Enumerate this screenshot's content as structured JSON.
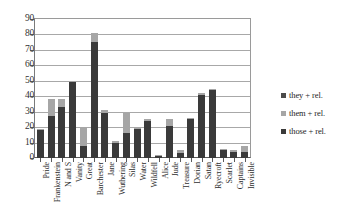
{
  "chart_data": {
    "type": "bar",
    "stacked": true,
    "title": "",
    "xlabel": "",
    "ylabel": "",
    "ylim": [
      0,
      90
    ],
    "ytick_step": 10,
    "yticks": [
      0,
      10,
      20,
      30,
      40,
      50,
      60,
      70,
      80,
      90
    ],
    "grid": true,
    "legend_position": "right",
    "categories": [
      "Pride",
      "Frankenstein",
      "N and S",
      "Vanity",
      "Great",
      "Barchester",
      "Jane",
      "Wuthering",
      "Silas",
      "Water",
      "Wildfell",
      "Alice",
      "Jude",
      "Treasure",
      "Dorian",
      "Satan",
      "Ryecroft",
      "Scarlet",
      "Captains",
      "Invisible"
    ],
    "series": [
      {
        "name": "those + rel.",
        "color": "#3a3a3a",
        "values": [
          18,
          27,
          33,
          49,
          8,
          75,
          29,
          10,
          16,
          19,
          24,
          1,
          21,
          3,
          25,
          41,
          44,
          5,
          4,
          4
        ]
      },
      {
        "name": "them + rel.",
        "color": "#a6a6a6",
        "values": [
          1,
          11,
          5,
          1,
          12,
          6,
          2,
          1,
          13,
          1,
          1,
          1,
          4,
          2,
          1,
          1,
          1,
          1,
          1,
          4
        ]
      },
      {
        "name": "they + rel.",
        "color": "#4b4b4b",
        "values": [
          0,
          0,
          0,
          0,
          0,
          0,
          0,
          0,
          0,
          0,
          0,
          0,
          0,
          0,
          0,
          0,
          0,
          0,
          0,
          0
        ]
      }
    ],
    "totals": [
      19,
      38,
      38,
      50,
      20,
      81,
      31,
      11,
      29,
      20,
      25,
      2,
      25,
      5,
      26,
      42,
      45,
      6,
      5,
      8
    ]
  },
  "legend": {
    "items": [
      {
        "label": "they + rel.",
        "color": "#4b4b4b"
      },
      {
        "label": "them + rel.",
        "color": "#a6a6a6"
      },
      {
        "label": "those + rel.",
        "color": "#3a3a3a"
      }
    ]
  },
  "axes": {
    "y_labels": [
      "90",
      "80",
      "70",
      "60",
      "50",
      "40",
      "30",
      "20",
      "10",
      "0"
    ]
  }
}
